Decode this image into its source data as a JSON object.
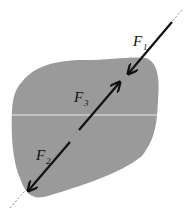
{
  "diagram": {
    "colors": {
      "body_fill": "#9a9a9a",
      "divider_line": "#e8e8e8",
      "arrow": "#111111",
      "line_of_action": "#9a9a9a",
      "background": "#ffffff"
    },
    "forces": [
      {
        "id": "F1",
        "symbol": "F",
        "subscript": "1",
        "direction": "down-left toward body"
      },
      {
        "id": "F2",
        "symbol": "F",
        "subscript": "2",
        "direction": "down-left away from body"
      },
      {
        "id": "F3",
        "symbol": "F",
        "subscript": "3",
        "direction": "up-right"
      }
    ]
  }
}
